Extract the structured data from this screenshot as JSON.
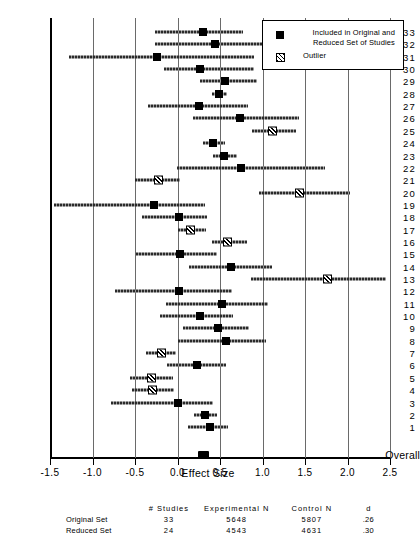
{
  "chart_data": {
    "type": "scatter",
    "title": "",
    "subtitle": "",
    "xlabel": "Effect Size",
    "ylabel": "",
    "xlim": [
      -1.5,
      2.5
    ],
    "xticks": [
      -1.5,
      -1.0,
      -0.5,
      0.0,
      0.5,
      1.0,
      1.5,
      2.0,
      2.5
    ],
    "xtick_labels": [
      "-1.5",
      "-1.0",
      "-0.5",
      "0.0",
      "0.5",
      "1.0",
      "1.5",
      "2.0",
      "2.5"
    ],
    "grid": "vertical",
    "legend_position": "top-right",
    "legend": [
      {
        "marker": "filled-square",
        "label": "Included in Original and Reduced Set of Studies"
      },
      {
        "marker": "hatched-square",
        "label": "Outlier"
      }
    ],
    "categories": [
      "33",
      "32",
      "31",
      "30",
      "29",
      "28",
      "27",
      "26",
      "25",
      "24",
      "23",
      "22",
      "21",
      "20",
      "19",
      "18",
      "17",
      "16",
      "15",
      "14",
      "13",
      "12",
      "11",
      "10",
      "9",
      "8",
      "7",
      "6",
      "5",
      "4",
      "3",
      "2",
      "1",
      "Overall"
    ],
    "series": [
      {
        "name": "Effect size with 95% confidence interval",
        "points": [
          {
            "label": "33",
            "d": 0.3,
            "low": -0.27,
            "high": 0.77,
            "outlier": false
          },
          {
            "label": "32",
            "d": 0.44,
            "low": -0.27,
            "high": 1.23,
            "outlier": false
          },
          {
            "label": "31",
            "d": -0.24,
            "low": -1.28,
            "high": 0.9,
            "outlier": false
          },
          {
            "label": "30",
            "d": 0.27,
            "low": -0.16,
            "high": 0.9,
            "outlier": false
          },
          {
            "label": "29",
            "d": 0.56,
            "low": 0.26,
            "high": 0.93,
            "outlier": false
          },
          {
            "label": "28",
            "d": 0.49,
            "low": 0.4,
            "high": 0.58,
            "outlier": false
          },
          {
            "label": "27",
            "d": 0.25,
            "low": -0.35,
            "high": 0.83,
            "outlier": false
          },
          {
            "label": "26",
            "d": 0.74,
            "low": 0.18,
            "high": 1.43,
            "outlier": false
          },
          {
            "label": "25",
            "d": 1.12,
            "low": 0.88,
            "high": 1.4,
            "outlier": true
          },
          {
            "label": "24",
            "d": 0.42,
            "low": 0.3,
            "high": 0.56,
            "outlier": false
          },
          {
            "label": "23",
            "d": 0.55,
            "low": 0.42,
            "high": 0.7,
            "outlier": false
          },
          {
            "label": "22",
            "d": 0.75,
            "low": -0.01,
            "high": 1.74,
            "outlier": false
          },
          {
            "label": "21",
            "d": -0.22,
            "low": -0.5,
            "high": 0.03,
            "outlier": true
          },
          {
            "label": "20",
            "d": 1.43,
            "low": 0.96,
            "high": 2.03,
            "outlier": true
          },
          {
            "label": "19",
            "d": -0.28,
            "low": -1.45,
            "high": 0.32,
            "outlier": false
          },
          {
            "label": "18",
            "d": 0.02,
            "low": -0.42,
            "high": 0.35,
            "outlier": false
          },
          {
            "label": "17",
            "d": 0.15,
            "low": 0.0,
            "high": 0.33,
            "outlier": true
          },
          {
            "label": "16",
            "d": 0.59,
            "low": 0.4,
            "high": 0.82,
            "outlier": true
          },
          {
            "label": "15",
            "d": 0.03,
            "low": -0.49,
            "high": 0.47,
            "outlier": false
          },
          {
            "label": "14",
            "d": 0.63,
            "low": 0.14,
            "high": 1.11,
            "outlier": false
          },
          {
            "label": "13",
            "d": 1.76,
            "low": 0.86,
            "high": 2.45,
            "outlier": true
          },
          {
            "label": "12",
            "d": 0.02,
            "low": -0.74,
            "high": 0.64,
            "outlier": false
          },
          {
            "label": "11",
            "d": 0.52,
            "low": -0.13,
            "high": 1.07,
            "outlier": false
          },
          {
            "label": "10",
            "d": 0.26,
            "low": -0.21,
            "high": 0.65,
            "outlier": false
          },
          {
            "label": "9",
            "d": 0.48,
            "low": 0.07,
            "high": 0.84,
            "outlier": false
          },
          {
            "label": "8",
            "d": 0.57,
            "low": 0.01,
            "high": 1.04,
            "outlier": false
          },
          {
            "label": "7",
            "d": -0.19,
            "low": -0.37,
            "high": -0.02,
            "outlier": true
          },
          {
            "label": "6",
            "d": 0.23,
            "low": -0.12,
            "high": 0.57,
            "outlier": false
          },
          {
            "label": "5",
            "d": -0.31,
            "low": -0.56,
            "high": -0.05,
            "outlier": true
          },
          {
            "label": "4",
            "d": -0.29,
            "low": -0.54,
            "high": -0.04,
            "outlier": true
          },
          {
            "label": "3",
            "d": 0.0,
            "low": -0.78,
            "high": 0.42,
            "outlier": false
          },
          {
            "label": "2",
            "d": 0.32,
            "low": 0.19,
            "high": 0.47,
            "outlier": false
          },
          {
            "label": "1",
            "d": 0.38,
            "low": 0.12,
            "high": 0.6,
            "outlier": false
          },
          {
            "label": "Overall",
            "d": 0.3,
            "low": 0.3,
            "high": 0.3,
            "outlier": false,
            "overall": true
          }
        ]
      }
    ]
  },
  "summary": {
    "headers": [
      "",
      "# Studies",
      "Experimental N",
      "Control N",
      "d"
    ],
    "rows": [
      {
        "name": "Original Set",
        "studies": "33",
        "experimental_n": "5648",
        "control_n": "5807",
        "d": ".26"
      },
      {
        "name": "Reduced Set",
        "studies": "24",
        "experimental_n": "4543",
        "control_n": "4631",
        "d": ".30"
      }
    ]
  }
}
